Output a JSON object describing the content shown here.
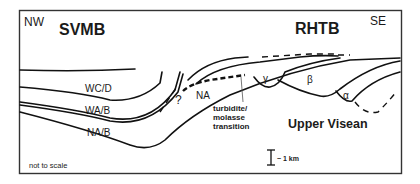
{
  "diagram": {
    "orientation": {
      "left": "NW",
      "right": "SE"
    },
    "basins": {
      "left": "SVMB",
      "right": "RHTB"
    },
    "units": {
      "wcd": "WC/D",
      "wab": "WA/B",
      "nab": "NA/B",
      "na": "NA",
      "question": "?",
      "gamma": "γ",
      "beta": "β",
      "alpha": "α"
    },
    "annotation": {
      "line1": "turbidite/",
      "line2": "molasse",
      "line3": "transition"
    },
    "age_label": "Upper Visean",
    "scale_bar_label": "~ 1 km",
    "scale_note": "not to scale",
    "colors": {
      "line": "#111111",
      "frame": "#333333",
      "background": "#ffffff"
    }
  }
}
